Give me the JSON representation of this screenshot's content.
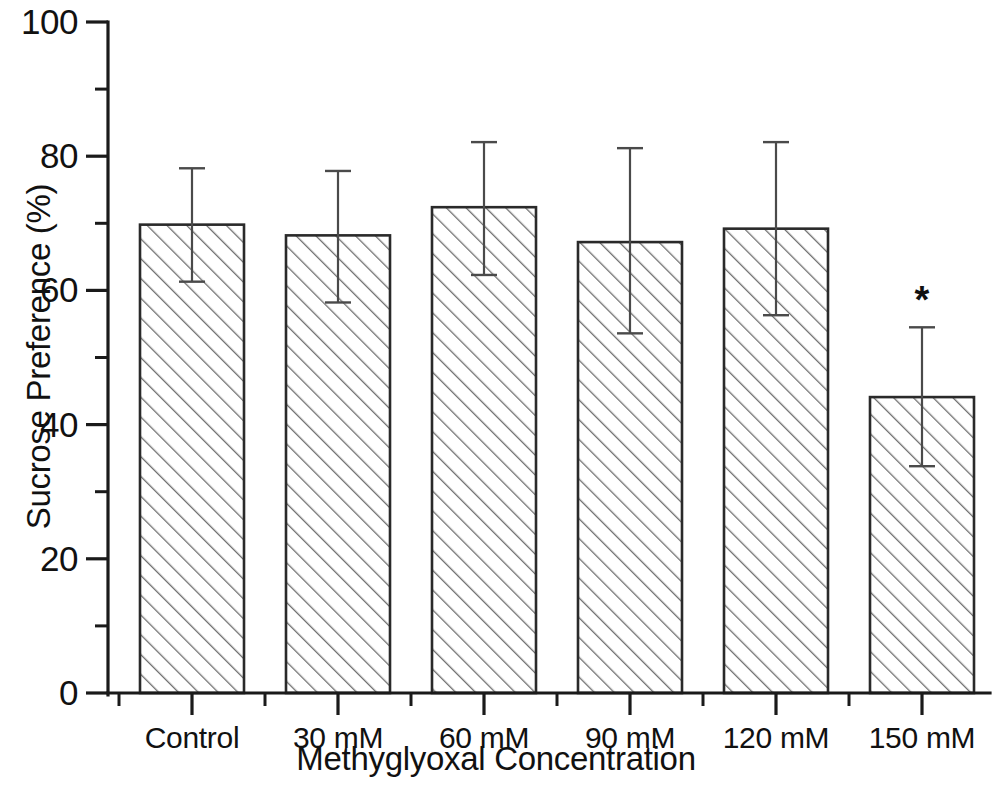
{
  "chart_data": {
    "type": "bar",
    "title": "",
    "xlabel": "Methyglyoxal Concentration",
    "ylabel": "Sucrose Preference (%)",
    "categories": [
      "Control",
      "30 mM",
      "60 mM",
      "90 mM",
      "120 mM",
      "150 mM"
    ],
    "values": [
      69.8,
      68.2,
      72.4,
      67.2,
      69.2,
      44.1
    ],
    "errors_upper": [
      78.2,
      77.8,
      82.1,
      81.2,
      82.1,
      54.5
    ],
    "errors_lower": [
      61.3,
      58.2,
      62.3,
      53.6,
      56.3,
      33.8
    ],
    "error_plus": [
      8.4,
      9.6,
      9.7,
      14.0,
      12.9,
      10.4
    ],
    "error_minus": [
      8.5,
      10.0,
      10.1,
      13.6,
      12.9,
      10.3
    ],
    "ylim": [
      0,
      100
    ],
    "ytick_labels": [
      "0",
      "20",
      "40",
      "60",
      "80",
      "100"
    ],
    "ytick_values": [
      0,
      20,
      40,
      60,
      80,
      100
    ],
    "yminor_values": [
      10,
      30,
      50,
      70,
      90
    ],
    "grid": false,
    "legend": null,
    "annotations": [
      {
        "text": "*",
        "category": "150 mM",
        "series_index": 5,
        "meaning": "significance-marker"
      }
    ],
    "bar_fill": "diagonal-hatch",
    "bar_fill_color": "#ffffff",
    "bar_edge_color": "#2a2a2a",
    "hatch_color": "#6e6e6e",
    "error_bar_color": "#4a4a4a"
  }
}
